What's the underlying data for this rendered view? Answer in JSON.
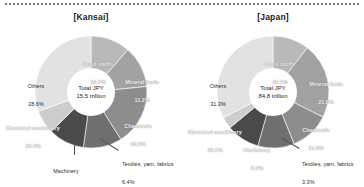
{
  "figure": {
    "divider": "dotted-rule",
    "source_note": ""
  },
  "colors": {
    "slice_foodstuffs": "#b9b9b9",
    "slice_mineral_fuels": "#a2a2a2",
    "slice_chemicals": "#8d8d8d",
    "slice_electrical_machinery": "#6f6f6f",
    "slice_machinery": "#4a4a4a",
    "slice_textiles": "#cdcdcd",
    "slice_others": "#e2e2e2",
    "hole": "#ffffff",
    "label_light": "#f2f2f2",
    "label_dark": "#2b2b2b"
  },
  "panels": [
    {
      "title": "[Kansai]",
      "center": {
        "line1": "Total JPY",
        "line2": "15.5 trillion"
      },
      "labels": {
        "foodstuffs": {
          "name": "Food stuffs",
          "value": "10.7%"
        },
        "mineral_fuels": {
          "name": "Mineral fuels",
          "value": "11.2%"
        },
        "chemicals": {
          "name": "Chemicals",
          "value": "16.5%"
        },
        "electrical_machinery": {
          "name": "Electrical machinery",
          "value": "10.4%"
        },
        "machinery": {
          "name": "Machinery",
          "value": "9.7%"
        },
        "textiles": {
          "name": "Textiles, yarn, fabrics",
          "value": "6.4%"
        },
        "others": {
          "name": "Others",
          "value": "28.6%"
        }
      }
    },
    {
      "title": "[Japan]",
      "center": {
        "line1": "Total JPY",
        "line2": "84.8 trillion"
      },
      "labels": {
        "foodstuffs": {
          "name": "Food stuffs",
          "value": "10.1%"
        },
        "mineral_fuels": {
          "name": "Mineral fuels",
          "value": "21.0%"
        },
        "chemicals": {
          "name": "Chemicals",
          "value": "11.0%"
        },
        "electrical_machinery": {
          "name": "Electrical machinery",
          "value": "10.1%"
        },
        "machinery": {
          "name": "Machinery",
          "value": "9.2%"
        },
        "textiles": {
          "name": "Textiles, yarn, fabrics",
          "value": "3.3%"
        },
        "others": {
          "name": "Others",
          "value": "31.3%"
        }
      }
    }
  ],
  "chart_data": [
    {
      "type": "pie",
      "title": "[Kansai]",
      "subtitle": "Total JPY 15.5 trillion",
      "categories": [
        "Food stuffs",
        "Mineral fuels",
        "Chemicals",
        "Electrical machinery",
        "Machinery",
        "Textiles, yarn, fabrics",
        "Others"
      ],
      "values": [
        10.7,
        11.2,
        16.5,
        10.4,
        9.7,
        6.4,
        28.6
      ],
      "unit": "%",
      "total_label": "Total JPY 15.5 trillion",
      "donut": true,
      "legend": "none",
      "labels_inline": true
    },
    {
      "type": "pie",
      "title": "[Japan]",
      "subtitle": "Total JPY 84.8 trillion",
      "categories": [
        "Food stuffs",
        "Mineral fuels",
        "Chemicals",
        "Electrical machinery",
        "Machinery",
        "Textiles, yarn, fabrics",
        "Others"
      ],
      "values": [
        10.1,
        21.0,
        11.0,
        10.1,
        9.2,
        3.3,
        31.3
      ],
      "unit": "%",
      "total_label": "Total JPY 84.8 trillion",
      "donut": true,
      "legend": "none",
      "labels_inline": true
    }
  ]
}
